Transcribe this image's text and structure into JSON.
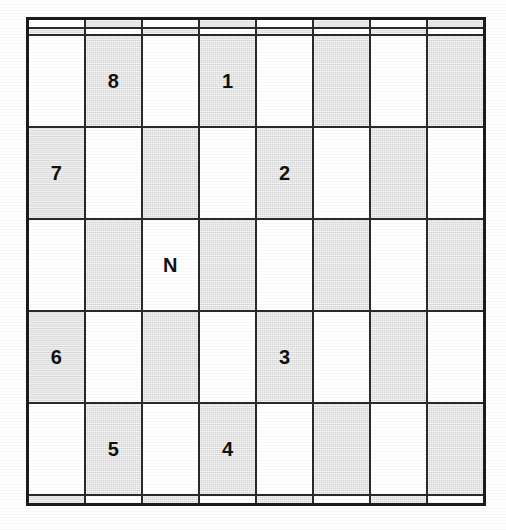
{
  "page": {
    "background_color": "#ffffff",
    "width": 506,
    "height": 530
  },
  "board": {
    "rows": 8,
    "columns": 8,
    "light_color": "#ffffff",
    "dark_color": "#d6d6d6",
    "border_color": "#1c1c1c",
    "gridline_color": "#2a2a2a",
    "label_color": "#111111",
    "shading_rule": "checkerboard: cell is dark when (row + column) is odd, using 1-based indices",
    "cells": [
      [
        {
          "shade": "light",
          "label": ""
        },
        {
          "shade": "dark",
          "label": ""
        },
        {
          "shade": "light",
          "label": ""
        },
        {
          "shade": "dark",
          "label": ""
        },
        {
          "shade": "light",
          "label": ""
        },
        {
          "shade": "dark",
          "label": ""
        },
        {
          "shade": "light",
          "label": ""
        },
        {
          "shade": "dark",
          "label": ""
        }
      ],
      [
        {
          "shade": "dark",
          "label": ""
        },
        {
          "shade": "light",
          "label": ""
        },
        {
          "shade": "dark",
          "label": ""
        },
        {
          "shade": "light",
          "label": ""
        },
        {
          "shade": "dark",
          "label": ""
        },
        {
          "shade": "light",
          "label": ""
        },
        {
          "shade": "dark",
          "label": ""
        },
        {
          "shade": "light",
          "label": ""
        }
      ],
      [
        {
          "shade": "light",
          "label": ""
        },
        {
          "shade": "dark",
          "label": "8"
        },
        {
          "shade": "light",
          "label": ""
        },
        {
          "shade": "dark",
          "label": "1"
        },
        {
          "shade": "light",
          "label": ""
        },
        {
          "shade": "dark",
          "label": ""
        },
        {
          "shade": "light",
          "label": ""
        },
        {
          "shade": "dark",
          "label": ""
        }
      ],
      [
        {
          "shade": "dark",
          "label": "7"
        },
        {
          "shade": "light",
          "label": ""
        },
        {
          "shade": "dark",
          "label": ""
        },
        {
          "shade": "light",
          "label": ""
        },
        {
          "shade": "dark",
          "label": "2"
        },
        {
          "shade": "light",
          "label": ""
        },
        {
          "shade": "dark",
          "label": ""
        },
        {
          "shade": "light",
          "label": ""
        }
      ],
      [
        {
          "shade": "light",
          "label": ""
        },
        {
          "shade": "dark",
          "label": ""
        },
        {
          "shade": "light",
          "label": "N"
        },
        {
          "shade": "dark",
          "label": ""
        },
        {
          "shade": "light",
          "label": ""
        },
        {
          "shade": "dark",
          "label": ""
        },
        {
          "shade": "light",
          "label": ""
        },
        {
          "shade": "dark",
          "label": ""
        }
      ],
      [
        {
          "shade": "dark",
          "label": "6"
        },
        {
          "shade": "light",
          "label": ""
        },
        {
          "shade": "dark",
          "label": ""
        },
        {
          "shade": "light",
          "label": ""
        },
        {
          "shade": "dark",
          "label": "3"
        },
        {
          "shade": "light",
          "label": ""
        },
        {
          "shade": "dark",
          "label": ""
        },
        {
          "shade": "light",
          "label": ""
        }
      ],
      [
        {
          "shade": "light",
          "label": ""
        },
        {
          "shade": "dark",
          "label": "5"
        },
        {
          "shade": "light",
          "label": ""
        },
        {
          "shade": "dark",
          "label": "4"
        },
        {
          "shade": "light",
          "label": ""
        },
        {
          "shade": "dark",
          "label": ""
        },
        {
          "shade": "light",
          "label": ""
        },
        {
          "shade": "dark",
          "label": ""
        }
      ],
      [
        {
          "shade": "dark",
          "label": ""
        },
        {
          "shade": "light",
          "label": ""
        },
        {
          "shade": "dark",
          "label": ""
        },
        {
          "shade": "light",
          "label": ""
        },
        {
          "shade": "dark",
          "label": ""
        },
        {
          "shade": "light",
          "label": ""
        },
        {
          "shade": "dark",
          "label": ""
        },
        {
          "shade": "light",
          "label": ""
        }
      ]
    ],
    "labeled_cells": [
      {
        "label": "8",
        "row": 3,
        "column": 2,
        "shade": "dark"
      },
      {
        "label": "1",
        "row": 3,
        "column": 4,
        "shade": "dark"
      },
      {
        "label": "7",
        "row": 4,
        "column": 1,
        "shade": "dark"
      },
      {
        "label": "2",
        "row": 4,
        "column": 5,
        "shade": "dark"
      },
      {
        "label": "N",
        "row": 5,
        "column": 3,
        "shade": "light"
      },
      {
        "label": "6",
        "row": 6,
        "column": 1,
        "shade": "dark"
      },
      {
        "label": "3",
        "row": 6,
        "column": 5,
        "shade": "dark"
      },
      {
        "label": "5",
        "row": 7,
        "column": 2,
        "shade": "dark"
      },
      {
        "label": "4",
        "row": 7,
        "column": 4,
        "shade": "dark"
      }
    ]
  }
}
